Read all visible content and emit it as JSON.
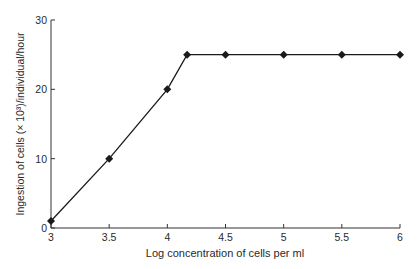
{
  "chart_data": {
    "type": "line",
    "title": "",
    "xlabel": "Log concentration of cells per ml",
    "ylabel": "Ingestion of cells (× 10³)/individual/hour",
    "xlim": [
      3,
      6
    ],
    "ylim": [
      0,
      30
    ],
    "x_ticks": [
      3,
      3.5,
      4,
      4.5,
      5,
      5.5,
      6
    ],
    "x_tick_labels": [
      "3",
      "3.5",
      "4",
      "4.5",
      "5",
      "5.5",
      "6"
    ],
    "y_ticks": [
      0,
      10,
      20,
      30
    ],
    "y_tick_labels": [
      "0",
      "10",
      "20",
      "30"
    ],
    "grid": false,
    "legend": null,
    "series": [
      {
        "name": "Ingestion rate",
        "marker": "diamond",
        "color": "#1a1a1a",
        "x": [
          3,
          3.5,
          4,
          4.17,
          4.5,
          5,
          5.5,
          6
        ],
        "y": [
          1,
          10,
          20,
          25,
          25,
          25,
          25,
          25
        ]
      }
    ]
  }
}
